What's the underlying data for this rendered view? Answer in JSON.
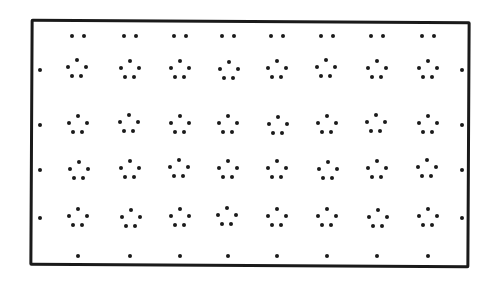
{
  "diagram": {
    "title": "",
    "grid": {
      "rows": 4,
      "cols": 8,
      "dots_per_cluster": 5
    },
    "cluster_centers_x": [
      78,
      130,
      180,
      228,
      277,
      327,
      377,
      428
    ],
    "cluster_centers_y": [
      70,
      125,
      170,
      218
    ],
    "top_pair_y": 36,
    "bottom_single_y": 256,
    "left_edge_x": 40,
    "right_edge_x": 462,
    "colors": {
      "ink": "#1a1a1a",
      "background": "#ffffff"
    }
  }
}
